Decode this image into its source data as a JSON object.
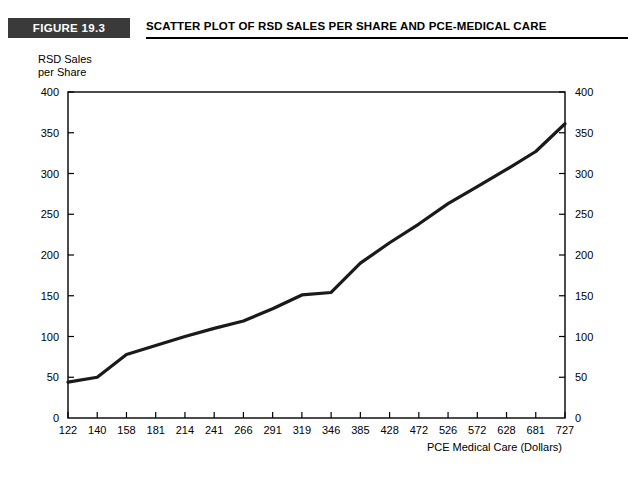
{
  "figure": {
    "badge_label": "FIGURE 19.3",
    "title": "SCATTER PLOT OF RSD SALES PER SHARE AND PCE-MEDICAL CARE"
  },
  "chart_data": {
    "type": "line",
    "title": "SCATTER PLOT OF RSD SALES PER SHARE AND PCE-MEDICAL CARE",
    "xlabel": "PCE Medical Care (Dollars)",
    "ylabel": "RSD Sales\nper Share",
    "ylabel_line1": "RSD Sales",
    "ylabel_line2": "per Share",
    "categories": [
      "122",
      "140",
      "158",
      "181",
      "214",
      "241",
      "266",
      "291",
      "319",
      "346",
      "385",
      "428",
      "472",
      "526",
      "572",
      "628",
      "681",
      "727"
    ],
    "x": [
      122,
      140,
      158,
      181,
      214,
      241,
      266,
      291,
      319,
      346,
      385,
      428,
      472,
      526,
      572,
      628,
      681,
      727
    ],
    "values": [
      44,
      50,
      78,
      89,
      100,
      110,
      119,
      134,
      151,
      154,
      190,
      215,
      238,
      263,
      284,
      305,
      327,
      361
    ],
    "ylim": [
      0,
      400
    ],
    "yticks": [
      0,
      50,
      100,
      150,
      200,
      250,
      300,
      350,
      400
    ],
    "y_axis_left_ticks": [
      "0",
      "50",
      "100",
      "150",
      "200",
      "250",
      "300",
      "350",
      "400"
    ],
    "y_axis_right_ticks": [
      "0",
      "50",
      "100",
      "150",
      "200",
      "250",
      "300",
      "350",
      "400"
    ],
    "grid": false,
    "legend": null,
    "series": [
      {
        "name": "RSD Sales per Share",
        "values": [
          44,
          50,
          78,
          89,
          100,
          110,
          119,
          134,
          151,
          154,
          190,
          215,
          238,
          263,
          284,
          305,
          327,
          361
        ]
      }
    ],
    "line_color": "#1a1a1a",
    "frame_color": "#000000"
  }
}
